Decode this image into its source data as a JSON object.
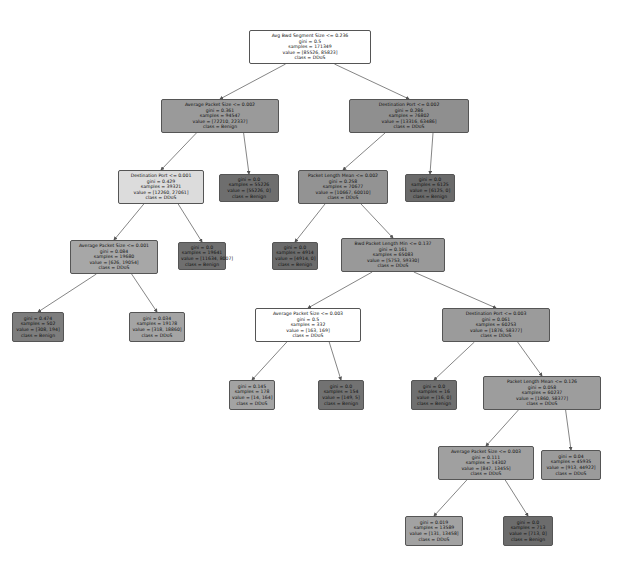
{
  "tree": {
    "nodes": [
      {
        "id": "n0",
        "x": 249,
        "y": 30,
        "w": 122,
        "h": 34,
        "fill": "#ffffff",
        "lines": [
          "Avg Bwd Segment Size <= 0.236",
          "gini = 0.5",
          "samples = 171349",
          "value = [85526, 85823]",
          "class = DDoS"
        ]
      },
      {
        "id": "n1",
        "x": 161,
        "y": 99,
        "w": 118,
        "h": 34,
        "fill": "#9a9a9a",
        "lines": [
          "Average Packet Size <= 0.002",
          "gini = 0.361",
          "samples = 94547",
          "value = [72210, 22337]",
          "class = Benign"
        ]
      },
      {
        "id": "n2",
        "x": 349,
        "y": 99,
        "w": 120,
        "h": 34,
        "fill": "#8f8f8f",
        "lines": [
          "Destination Port <= 0.002",
          "gini = 0.286",
          "samples = 76802",
          "value = [13316, 63486]",
          "class = DDoS"
        ]
      },
      {
        "id": "n3",
        "x": 118,
        "y": 170,
        "w": 86,
        "h": 34,
        "fill": "#dcdcdc",
        "lines": [
          "Destination Port <= 0.001",
          "gini = 0.429",
          "samples = 39321",
          "value = [12260, 27061]",
          "class = DDoS"
        ]
      },
      {
        "id": "n4",
        "x": 219,
        "y": 174,
        "w": 60,
        "h": 28,
        "fill": "#6e6e6e",
        "lines": [
          "gini = 0.0",
          "samples = 55226",
          "value = [55226, 0]",
          "class = Benign"
        ]
      },
      {
        "id": "n5",
        "x": 298,
        "y": 170,
        "w": 90,
        "h": 34,
        "fill": "#939393",
        "lines": [
          "Packet Length Mean <= 0.002",
          "gini = 0.258",
          "samples = 70677",
          "value = [10667, 60010]",
          "class = DDoS"
        ]
      },
      {
        "id": "n6",
        "x": 405,
        "y": 174,
        "w": 50,
        "h": 28,
        "fill": "#6a6a6a",
        "lines": [
          "gini = 0.0",
          "samples = 6125",
          "value = [6125, 0]",
          "class = Benign"
        ]
      },
      {
        "id": "n7",
        "x": 70,
        "y": 240,
        "w": 88,
        "h": 34,
        "fill": "#a7a7a7",
        "lines": [
          "Average Packet Size <= 0.001",
          "gini = 0.084",
          "samples = 19680",
          "value = [626, 19054]",
          "class = DDoS"
        ]
      },
      {
        "id": "n8",
        "x": 178,
        "y": 242,
        "w": 48,
        "h": 28,
        "fill": "#6f6f6f",
        "lines": [
          "gini = 0.0",
          "samples = 19641",
          "value = [11634, 8007]",
          "class = Benign"
        ]
      },
      {
        "id": "n9",
        "x": 272,
        "y": 242,
        "w": 46,
        "h": 28,
        "fill": "#6b6b6b",
        "lines": [
          "gini = 0.0",
          "samples = 4914",
          "value = [4914, 0]",
          "class = Benign"
        ]
      },
      {
        "id": "n10",
        "x": 341,
        "y": 238,
        "w": 104,
        "h": 34,
        "fill": "#999999",
        "lines": [
          "Bwd Packet Length Min <= 0.137",
          "gini = 0.161",
          "samples = 65083",
          "value = [5753, 59330]",
          "class = DDoS"
        ]
      },
      {
        "id": "n11",
        "x": 12,
        "y": 312,
        "w": 52,
        "h": 30,
        "fill": "#7d7d7d",
        "lines": [
          "gini = 0.474",
          "samples = 502",
          "value = [308, 194]",
          "class = Benign"
        ]
      },
      {
        "id": "n12",
        "x": 129,
        "y": 312,
        "w": 56,
        "h": 30,
        "fill": "#a4a4a4",
        "lines": [
          "gini = 0.034",
          "samples = 19178",
          "value = [318, 18860]",
          "class = DDoS"
        ]
      },
      {
        "id": "n13",
        "x": 255,
        "y": 308,
        "w": 106,
        "h": 34,
        "fill": "#ffffff",
        "lines": [
          "Average Packet Size <= 0.003",
          "gini = 0.5",
          "samples = 332",
          "value = [163, 169]",
          "class = DDoS"
        ]
      },
      {
        "id": "n14",
        "x": 442,
        "y": 308,
        "w": 108,
        "h": 34,
        "fill": "#9b9b9b",
        "lines": [
          "Destination Port <= 0.003",
          "gini = 0.061",
          "samples = 60253",
          "value = [1876, 58377]",
          "class = DDoS"
        ]
      },
      {
        "id": "n15",
        "x": 229,
        "y": 380,
        "w": 46,
        "h": 30,
        "fill": "#a3a3a3",
        "lines": [
          "gini = 0.145",
          "samples = 178",
          "value = [14, 164]",
          "class = DDoS"
        ]
      },
      {
        "id": "n16",
        "x": 318,
        "y": 380,
        "w": 46,
        "h": 30,
        "fill": "#727272",
        "lines": [
          "gini = 0.0",
          "samples = 154",
          "value = [149, 5]",
          "class = Benign"
        ]
      },
      {
        "id": "n17",
        "x": 411,
        "y": 380,
        "w": 46,
        "h": 30,
        "fill": "#6f6f6f",
        "lines": [
          "gini = 0.0",
          "samples = 16",
          "value = [16, 0]",
          "class = Benign"
        ]
      },
      {
        "id": "n18",
        "x": 483,
        "y": 376,
        "w": 118,
        "h": 34,
        "fill": "#9d9d9d",
        "lines": [
          "Packet Length Mean <= 0.126",
          "gini = 0.058",
          "samples = 60237",
          "value = [1860, 58377]",
          "class = DDoS"
        ]
      },
      {
        "id": "n19",
        "x": 438,
        "y": 446,
        "w": 96,
        "h": 34,
        "fill": "#a0a0a0",
        "lines": [
          "Average Packet Size <= 0.003",
          "gini = 0.111",
          "samples = 14302",
          "value = [847, 13455]",
          "class = DDoS"
        ]
      },
      {
        "id": "n20",
        "x": 541,
        "y": 450,
        "w": 60,
        "h": 30,
        "fill": "#9b9b9b",
        "lines": [
          "gini = 0.04",
          "samples = 45935",
          "value = [913, 44922]",
          "class = DDoS"
        ]
      },
      {
        "id": "n21",
        "x": 405,
        "y": 516,
        "w": 58,
        "h": 30,
        "fill": "#a2a2a2",
        "lines": [
          "gini = 0.019",
          "samples = 13589",
          "value = [131, 13458]",
          "class = DDoS"
        ]
      },
      {
        "id": "n22",
        "x": 503,
        "y": 516,
        "w": 50,
        "h": 30,
        "fill": "#6c6c6c",
        "lines": [
          "gini = 0.0",
          "samples = 713",
          "value = [713, 0]",
          "class = Benign"
        ]
      }
    ],
    "edges": [
      [
        "n0",
        "n1"
      ],
      [
        "n0",
        "n2"
      ],
      [
        "n1",
        "n3"
      ],
      [
        "n1",
        "n4"
      ],
      [
        "n2",
        "n5"
      ],
      [
        "n2",
        "n6"
      ],
      [
        "n3",
        "n7"
      ],
      [
        "n3",
        "n8"
      ],
      [
        "n5",
        "n9"
      ],
      [
        "n5",
        "n10"
      ],
      [
        "n7",
        "n11"
      ],
      [
        "n7",
        "n12"
      ],
      [
        "n10",
        "n13"
      ],
      [
        "n10",
        "n14"
      ],
      [
        "n13",
        "n15"
      ],
      [
        "n13",
        "n16"
      ],
      [
        "n14",
        "n17"
      ],
      [
        "n14",
        "n18"
      ],
      [
        "n18",
        "n19"
      ],
      [
        "n18",
        "n20"
      ],
      [
        "n19",
        "n21"
      ],
      [
        "n19",
        "n22"
      ]
    ]
  }
}
